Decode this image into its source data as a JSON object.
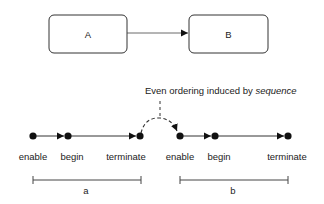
{
  "boxes": [
    {
      "label": "A"
    },
    {
      "label": "B"
    }
  ],
  "annotation": {
    "prefix": "Even ordering induced by ",
    "emphasis": "sequence"
  },
  "events_a": [
    "enable",
    "begin",
    "terminate"
  ],
  "events_b": [
    "enable",
    "begin",
    "terminate"
  ],
  "spans": [
    {
      "label": "a"
    },
    {
      "label": "b"
    }
  ],
  "colors": {
    "stroke": "#333333",
    "node": "#111111",
    "background": "#ffffff"
  }
}
